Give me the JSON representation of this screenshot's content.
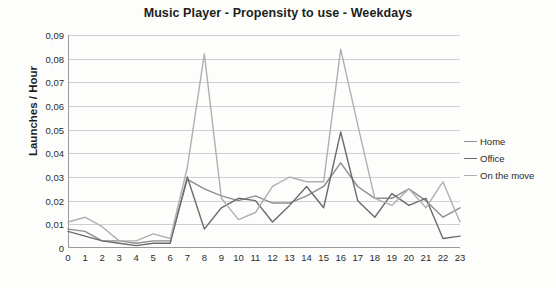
{
  "chart_data": {
    "type": "line",
    "title": "Music Player - Propensity to use - Weekdays",
    "xlabel": "",
    "ylabel": "Launches / Hour",
    "x": [
      0,
      1,
      2,
      3,
      4,
      5,
      6,
      7,
      8,
      9,
      10,
      11,
      12,
      13,
      14,
      15,
      16,
      17,
      18,
      19,
      20,
      21,
      22,
      23
    ],
    "xtick_labels": [
      "0",
      "1",
      "2",
      "3",
      "4",
      "5",
      "6",
      "7",
      "8",
      "9",
      "10",
      "11",
      "12",
      "13",
      "14",
      "15",
      "16",
      "17",
      "18",
      "19",
      "20",
      "21",
      "22",
      "23"
    ],
    "ytick_labels": [
      "0",
      "0,01",
      "0,02",
      "0,03",
      "0,04",
      "0,05",
      "0,06",
      "0,07",
      "0,08",
      "0,09"
    ],
    "ytick_values": [
      0,
      0.01,
      0.02,
      0.03,
      0.04,
      0.05,
      0.06,
      0.07,
      0.08,
      0.09
    ],
    "ylim": [
      0,
      0.09
    ],
    "xlim": [
      0,
      23
    ],
    "grid": "horizontal",
    "legend_position": "right",
    "series": [
      {
        "name": "Home",
        "color": "#8d8d8d",
        "values": [
          0.008,
          0.007,
          0.003,
          0.003,
          0.002,
          0.003,
          0.003,
          0.029,
          0.025,
          0.022,
          0.02,
          0.022,
          0.019,
          0.019,
          0.022,
          0.026,
          0.036,
          0.026,
          0.021,
          0.021,
          0.025,
          0.02,
          0.013,
          0.017
        ]
      },
      {
        "name": "Office",
        "color": "#6b6b6b",
        "values": [
          0.007,
          0.005,
          0.003,
          0.002,
          0.001,
          0.002,
          0.002,
          0.03,
          0.008,
          0.017,
          0.021,
          0.02,
          0.011,
          0.018,
          0.026,
          0.017,
          0.049,
          0.02,
          0.013,
          0.023,
          0.018,
          0.021,
          0.004,
          0.005
        ]
      },
      {
        "name": "On the move",
        "color": "#b0b0b0",
        "values": [
          0.011,
          0.013,
          0.009,
          0.003,
          0.003,
          0.006,
          0.004,
          0.034,
          0.082,
          0.021,
          0.012,
          0.015,
          0.026,
          0.03,
          0.028,
          0.028,
          0.084,
          0.052,
          0.021,
          0.018,
          0.025,
          0.017,
          0.028,
          0.011
        ]
      }
    ]
  },
  "legend": {
    "items": [
      {
        "label": "Home"
      },
      {
        "label": "Office"
      },
      {
        "label": "On the move"
      }
    ]
  }
}
